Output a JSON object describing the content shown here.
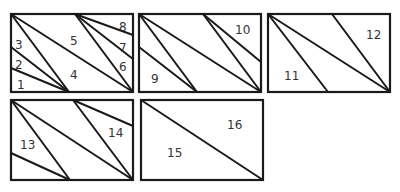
{
  "diagram": {
    "panels": [
      {
        "id": "panel-1",
        "labels": [
          "1",
          "2",
          "3",
          "4",
          "5",
          "6",
          "7",
          "8"
        ]
      },
      {
        "id": "panel-2",
        "labels": [
          "9",
          "10"
        ]
      },
      {
        "id": "panel-3",
        "labels": [
          "11",
          "12"
        ]
      },
      {
        "id": "panel-4",
        "labels": [
          "13",
          "14"
        ]
      },
      {
        "id": "panel-5",
        "labels": [
          "15",
          "16"
        ]
      }
    ],
    "regions": {
      "r1": "1",
      "r2": "2",
      "r3": "3",
      "r4": "4",
      "r5": "5",
      "r6": "6",
      "r7": "7",
      "r8": "8",
      "r9": "9",
      "r10": "10",
      "r11": "11",
      "r12": "12",
      "r13": "13",
      "r14": "14",
      "r15": "15",
      "r16": "16"
    },
    "stroke_color": "#1a1a1a",
    "label_color": "#333333"
  }
}
